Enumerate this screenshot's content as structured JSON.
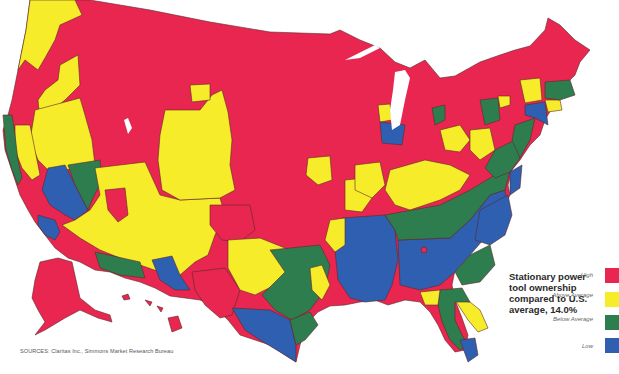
{
  "legend": {
    "title": "Stationary power tool ownership compared to U.S. average, 14.0%",
    "items": [
      {
        "label": "High",
        "color": "#e8264f"
      },
      {
        "label": "Above Average",
        "color": "#f7ec2a"
      },
      {
        "label": "Below Average",
        "color": "#2e7d4f"
      },
      {
        "label": "Low",
        "color": "#2e5fb0"
      }
    ]
  },
  "sources": "SOURCES: Claritas Inc., Simmons Market Research Bureau",
  "colors": {
    "high": "#e8264f",
    "above": "#f7ec2a",
    "below": "#2e7d4f",
    "low": "#2e5fb0",
    "water": "#ffffff"
  }
}
